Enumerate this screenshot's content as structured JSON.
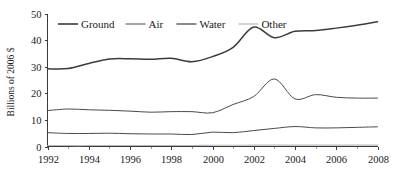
{
  "chart_data": {
    "type": "line",
    "title": "",
    "subtitle": "",
    "xlabel": "",
    "ylabel": "Billions of 2006 $",
    "xlim": [
      1992,
      2008
    ],
    "ylim": [
      0,
      50
    ],
    "grid": false,
    "legend_position": "top-left-inside",
    "x_tick_labels": [
      "1992",
      "1994",
      "1996",
      "1998",
      "2000",
      "2002",
      "2004",
      "2006",
      "2008"
    ],
    "x_ticks": [
      1992,
      1994,
      1996,
      1998,
      2000,
      2002,
      2004,
      2006,
      2008
    ],
    "x_minor_ticks": [
      1993,
      1995,
      1997,
      1999,
      2001,
      2003,
      2005,
      2007
    ],
    "y_tick_labels": [
      "0",
      "10",
      "20",
      "30",
      "40",
      "50"
    ],
    "y_ticks": [
      0,
      10,
      20,
      30,
      40,
      50
    ],
    "x": [
      1992,
      1993,
      1994,
      1995,
      1996,
      1997,
      1998,
      1999,
      2000,
      2001,
      2002,
      2003,
      2004,
      2005,
      2006,
      2007,
      2008
    ],
    "series": [
      {
        "name": "Ground",
        "color": "#3c3c3c",
        "values": [
          29.2,
          29.3,
          31.2,
          32.9,
          33.0,
          32.8,
          33.2,
          31.9,
          33.8,
          37.3,
          44.9,
          40.9,
          43.3,
          43.6,
          44.5,
          45.6,
          46.9
        ]
      },
      {
        "name": "Air",
        "color": "#4a4a4a",
        "values": [
          5.2,
          4.9,
          4.9,
          5.0,
          4.8,
          4.7,
          4.7,
          4.5,
          5.4,
          5.2,
          6.0,
          6.8,
          7.5,
          7.0,
          7.0,
          7.2,
          7.4
        ]
      },
      {
        "name": "Water",
        "color": "#4a4a4a",
        "values": [
          13.5,
          14.1,
          13.8,
          13.6,
          13.3,
          12.9,
          13.1,
          13.1,
          12.7,
          15.8,
          18.8,
          25.4,
          17.9,
          19.5,
          18.5,
          18.2,
          18.2
        ]
      },
      {
        "name": "Other",
        "color": "#bdbdbd",
        "values": [
          0.35,
          0.35,
          0.35,
          0.4,
          0.4,
          0.4,
          0.4,
          0.4,
          0.45,
          0.45,
          0.5,
          0.5,
          0.5,
          0.5,
          0.5,
          0.5,
          0.5
        ]
      }
    ],
    "legend": [
      {
        "label": "Ground"
      },
      {
        "label": "Air"
      },
      {
        "label": "Water"
      },
      {
        "label": "Other"
      }
    ]
  }
}
